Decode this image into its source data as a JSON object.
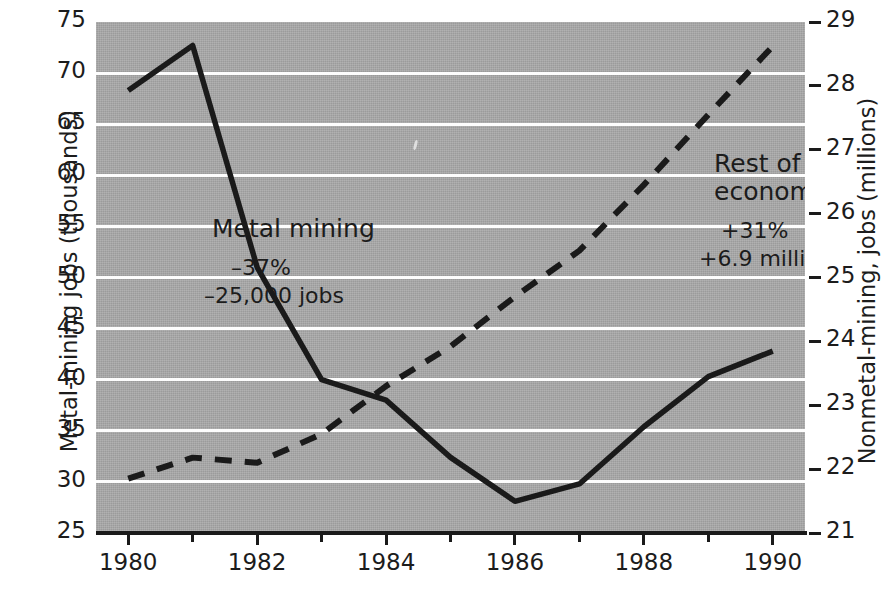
{
  "chart_data": {
    "type": "line",
    "title": "",
    "xlabel": "",
    "x": [
      1980,
      1981,
      1982,
      1983,
      1984,
      1985,
      1986,
      1987,
      1988,
      1989,
      1990
    ],
    "xlim": [
      1979.5,
      1990.5
    ],
    "grid": true,
    "legend": "inline annotations",
    "left_axis": {
      "label": "Metal-mining jobs (thousands)",
      "ylim": [
        25,
        75
      ],
      "ticks": [
        25,
        30,
        35,
        40,
        45,
        50,
        55,
        60,
        65,
        70,
        75
      ]
    },
    "right_axis": {
      "label": "Nonmetal-mining, jobs (millions)",
      "ylim": [
        21,
        29
      ],
      "ticks": [
        21,
        22,
        23,
        24,
        25,
        26,
        27,
        28,
        29
      ]
    },
    "series": [
      {
        "name": "Metal mining",
        "axis": "left",
        "style": "solid",
        "units": "thousands of jobs",
        "values": [
          68.3,
          72.7,
          51.0,
          40.0,
          38.0,
          32.4,
          28.1,
          29.8,
          35.4,
          40.3,
          42.8
        ]
      },
      {
        "name": "Rest of economy",
        "axis": "right",
        "style": "dashed",
        "units": "millions of jobs",
        "values": [
          21.85,
          22.18,
          22.1,
          22.55,
          23.3,
          23.92,
          24.7,
          25.42,
          26.45,
          27.55,
          28.62
        ]
      }
    ],
    "annotations": [
      {
        "name": "metal-mining",
        "title": "Metal mining",
        "pct": "–37%",
        "jobs": "–25,000 jobs"
      },
      {
        "name": "rest-of-economy",
        "title": "Rest of\neconomy",
        "pct": "+31%",
        "jobs": "+6.9 million jobs"
      }
    ]
  },
  "axes": {
    "left": {
      "title": "Metal-mining jobs (thousands)",
      "ticks": [
        "75",
        "70",
        "65",
        "60",
        "55",
        "50",
        "45",
        "40",
        "35",
        "30",
        "25"
      ]
    },
    "right": {
      "title": "Nonmetal-mining, jobs (millions)",
      "ticks": [
        "29",
        "28",
        "27",
        "26",
        "25",
        "24",
        "23",
        "22",
        "21"
      ]
    },
    "bottom": {
      "ticks": [
        "1980",
        "1982",
        "1984",
        "1986",
        "1988",
        "1990"
      ]
    }
  },
  "annotations": {
    "metal": {
      "title": "Metal mining",
      "pct": "–37%",
      "jobs": "–25,000 jobs"
    },
    "rest": {
      "title_line1": "Rest of",
      "title_line2": "economy",
      "pct": "+31%",
      "jobs": "+6.9 million jobs"
    }
  },
  "colors": {
    "plot_background": "#a9a9a9",
    "gridline": "#fdfdfd",
    "line": "#1a1a1a",
    "text": "#1c1c1c",
    "page_background": "#ffffff"
  }
}
